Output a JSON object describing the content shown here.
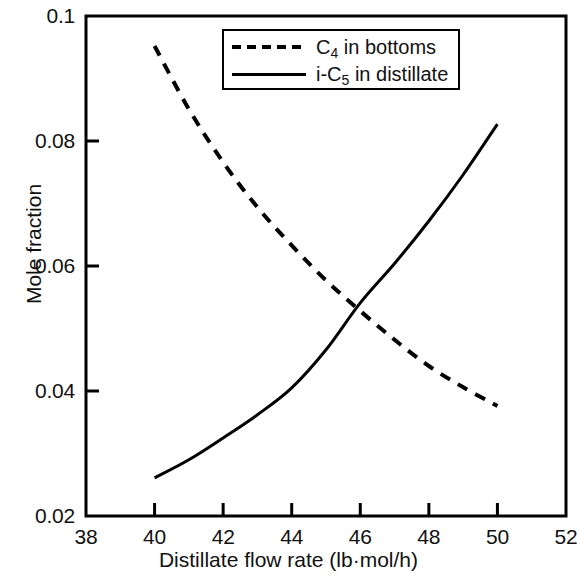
{
  "chart_data": {
    "type": "line",
    "title": "",
    "subtitle": "",
    "xlabel": "Distillate flow rate (lb·mol/h)",
    "ylabel": "Mole fraction",
    "xlim": [
      38,
      52
    ],
    "ylim": [
      0.02,
      0.1
    ],
    "xticks": [
      38,
      40,
      42,
      44,
      46,
      48,
      50,
      52
    ],
    "xtick_labels": [
      "38",
      "40",
      "42",
      "44",
      "46",
      "48",
      "50",
      "52"
    ],
    "yticks": [
      0.02,
      0.04,
      0.06,
      0.08,
      0.1
    ],
    "ytick_labels": [
      "0.02",
      "0.04",
      "0.06",
      "0.08",
      "0.1"
    ],
    "grid": false,
    "legend_position": "top-center",
    "series": [
      {
        "name": "C4 in bottoms",
        "label_main": "C",
        "label_sub": "4",
        "label_tail": " in bottoms",
        "style": "dashed",
        "color": "#000000",
        "x": [
          40,
          41,
          42,
          43,
          44,
          45,
          46,
          47,
          48,
          49,
          50
        ],
        "values": [
          0.0952,
          0.0851,
          0.0766,
          0.0694,
          0.0633,
          0.0577,
          0.0528,
          0.0482,
          0.044,
          0.0406,
          0.0376
        ]
      },
      {
        "name": "i-C5 in distillate",
        "label_main": "i-C",
        "label_sub": "5",
        "label_tail": " in distillate",
        "style": "solid",
        "color": "#000000",
        "x": [
          40,
          41,
          42,
          43,
          44,
          45,
          46,
          47,
          48,
          49,
          50
        ],
        "values": [
          0.0261,
          0.029,
          0.0325,
          0.0362,
          0.0405,
          0.0466,
          0.0541,
          0.0604,
          0.0672,
          0.0746,
          0.0827
        ]
      }
    ],
    "annotations": {
      "crossover_x": 46.05,
      "crossover_y": 0.0535
    }
  },
  "axes": {
    "frame_color": "#000000",
    "x_title": "Distillate flow rate (lb·mol/h)",
    "y_title": "Mole fraction"
  },
  "legend": {
    "entries": [
      {
        "main": "C",
        "sub": "4",
        "tail": " in bottoms",
        "style": "dashed"
      },
      {
        "main": "i-C",
        "sub": "5",
        "tail": " in distillate",
        "style": "solid"
      }
    ]
  }
}
